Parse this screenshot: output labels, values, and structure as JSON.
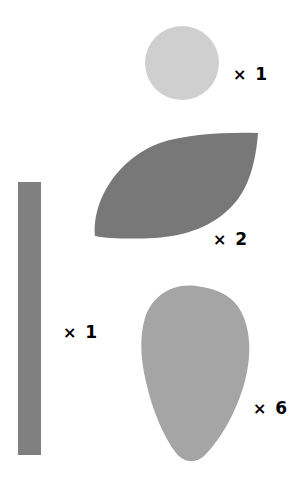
{
  "figure": {
    "background_color": "#ffffff",
    "width": 302,
    "height": 492,
    "multiplication_sign": "×"
  },
  "shapes": [
    {
      "id": "circle",
      "name": "light-gray-circle",
      "kind": "circle",
      "color": "#cfcfcf",
      "count": "1",
      "count_text": "× 1",
      "bbox": {
        "x": 145,
        "y": 26,
        "width": 74,
        "height": 74
      },
      "label_position": {
        "x": 233,
        "y": 66
      }
    },
    {
      "id": "leaf",
      "name": "dark-gray-leaf",
      "kind": "lens",
      "color": "#787878",
      "count": "2",
      "count_text": "× 2",
      "bbox": {
        "x": 95,
        "y": 133,
        "width": 163,
        "height": 105
      },
      "label_position": {
        "x": 213,
        "y": 231
      }
    },
    {
      "id": "bar",
      "name": "gray-vertical-bar",
      "kind": "rectangle",
      "color": "#808080",
      "count": "1",
      "count_text": "× 1",
      "bbox": {
        "x": 18,
        "y": 182,
        "width": 23,
        "height": 273
      },
      "label_position": {
        "x": 63,
        "y": 324
      }
    },
    {
      "id": "blob",
      "name": "gray-egg-blob",
      "kind": "teardrop",
      "color": "#a5a5a5",
      "count": "6",
      "count_text": "× 6",
      "bbox": {
        "x": 142,
        "y": 285,
        "width": 106,
        "height": 177
      },
      "label_position": {
        "x": 253,
        "y": 400
      }
    }
  ],
  "labels": {
    "circle": {
      "sign": "×",
      "value": "1"
    },
    "leaf": {
      "sign": "×",
      "value": "2"
    },
    "bar": {
      "sign": "×",
      "value": "1"
    },
    "blob": {
      "sign": "×",
      "value": "6"
    }
  }
}
